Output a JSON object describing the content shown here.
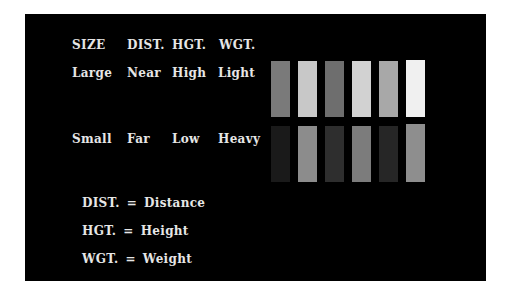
{
  "header": {
    "columns": [
      "SIZE",
      "DIST.",
      "HGT.",
      "WGT."
    ]
  },
  "rows": {
    "top": [
      "Large",
      "Near",
      "High",
      "Light"
    ],
    "bottom": [
      "Small",
      "Far",
      "Low",
      "Heavy"
    ]
  },
  "bars": {
    "top_colors": [
      "#7a7a7a",
      "#c8c8c8",
      "#6e6e6e",
      "#d2d2d2",
      "#a8a8a8",
      "#f0f0f0"
    ],
    "bottom_colors": [
      "#1a1a1a",
      "#8c8c8c",
      "#2e2e2e",
      "#7c7c7c",
      "#262626",
      "#8e8e8e"
    ]
  },
  "legend": [
    {
      "abbr": "DIST.",
      "eq": "=",
      "full": "Distance"
    },
    {
      "abbr": "HGT.",
      "eq": "=",
      "full": "Height"
    },
    {
      "abbr": "WGT.",
      "eq": "=",
      "full": "Weight"
    }
  ],
  "colors": {
    "panel_bg": "#000000",
    "page_bg": "#ffffff",
    "text": "#e6e6e6"
  }
}
